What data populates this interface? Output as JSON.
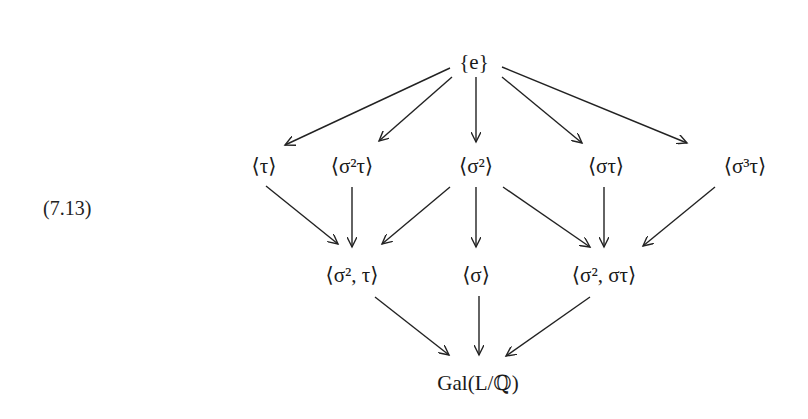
{
  "equation_number": "(7.13)",
  "nodes": {
    "e": "{e}",
    "tau": "⟨τ⟩",
    "s2tau": "⟨σ²τ⟩",
    "s2": "⟨σ²⟩",
    "stau": "⟨στ⟩",
    "s3tau": "⟨σ³τ⟩",
    "s2_tau": "⟨σ², τ⟩",
    "s": "⟨σ⟩",
    "s2_stau": "⟨σ², στ⟩",
    "gal": "Gal(L/ℚ)"
  },
  "edges": [
    [
      "e",
      "tau"
    ],
    [
      "e",
      "s2tau"
    ],
    [
      "e",
      "s2"
    ],
    [
      "e",
      "stau"
    ],
    [
      "e",
      "s3tau"
    ],
    [
      "tau",
      "s2_tau"
    ],
    [
      "s2tau",
      "s2_tau"
    ],
    [
      "s2",
      "s2_tau"
    ],
    [
      "s2",
      "s"
    ],
    [
      "s2",
      "s2_stau"
    ],
    [
      "stau",
      "s2_stau"
    ],
    [
      "s3tau",
      "s2_stau"
    ],
    [
      "s2_tau",
      "gal"
    ],
    [
      "s",
      "gal"
    ],
    [
      "s2_stau",
      "gal"
    ]
  ]
}
